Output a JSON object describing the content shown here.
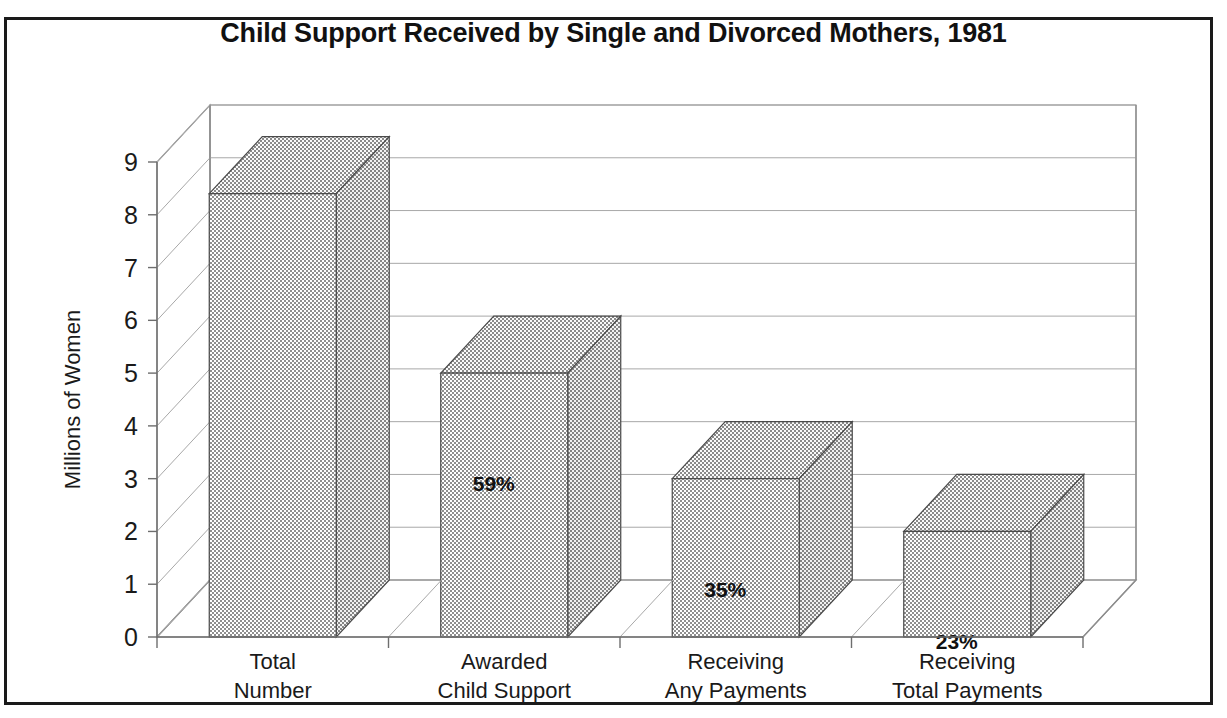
{
  "document": {
    "title": "Child Support Received by Single and Divorced Mothers, 1981",
    "frame_color": "#1a1a1a"
  },
  "chart_data": {
    "type": "bar",
    "title": "Child Support Received by Single and Divorced Mothers, 1981",
    "xlabel": "",
    "ylabel": "Millions of Women",
    "ylim": [
      0,
      9
    ],
    "ytick_labels": [
      "0",
      "1",
      "2",
      "3",
      "4",
      "5",
      "6",
      "7",
      "8",
      "9"
    ],
    "ytick_values": [
      0,
      1,
      2,
      3,
      4,
      5,
      6,
      7,
      8,
      9
    ],
    "grid": true,
    "legend": "none",
    "three_d": true,
    "categories": [
      "Total\nNumber",
      "Awarded\nChild Support",
      "Receiving\nAny Payments",
      "Receiving\nTotal Payments"
    ],
    "category_lines": [
      [
        "Total",
        "Number"
      ],
      [
        "Awarded",
        "Child Support"
      ],
      [
        "Receiving",
        "Any Payments"
      ],
      [
        "Receiving",
        "Total Payments"
      ]
    ],
    "values": [
      8.4,
      5.0,
      3.0,
      2.0
    ],
    "data_labels": [
      "",
      "59%",
      "35%",
      "23%"
    ],
    "series_name": "Millions of Women",
    "bar_fill": "#b3b3b3",
    "bar_edge": "#4a4a4a"
  }
}
